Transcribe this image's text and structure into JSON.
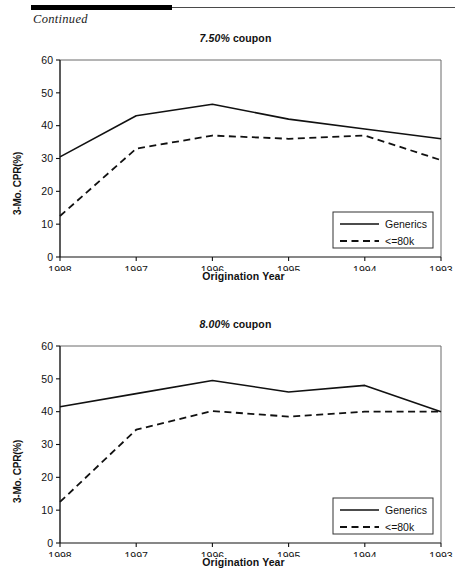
{
  "page": {
    "continued_label": "Continued"
  },
  "axes": {
    "ylabel": "3-Mo. CPR(%)",
    "xlabel": "Origination Year",
    "yticks": [
      "0",
      "10",
      "20",
      "30",
      "40",
      "50",
      "60"
    ],
    "xticks": [
      "1998",
      "1997",
      "1996",
      "1995",
      "1994",
      "1993"
    ]
  },
  "legend": {
    "generics_label": "Generics",
    "lte80k_label": "<=80k"
  },
  "chart_data": [
    {
      "type": "line",
      "title": "7.50% coupon",
      "coupon": "7.50%",
      "coupon_suffix": " coupon",
      "xlabel": "Origination Year",
      "ylabel": "3-Mo. CPR(%)",
      "categories": [
        "1998",
        "1997",
        "1996",
        "1995",
        "1994",
        "1993"
      ],
      "ylim": [
        0,
        60
      ],
      "ytick_step": 10,
      "grid": false,
      "legend_position": "bottom-right",
      "series": [
        {
          "name": "Generics",
          "style": "solid",
          "values": [
            30.5,
            43.0,
            46.5,
            42.0,
            39.0,
            36.0
          ]
        },
        {
          "name": "<=80k",
          "style": "dashed",
          "values": [
            12.5,
            33.0,
            37.0,
            36.0,
            37.0,
            29.5
          ]
        }
      ]
    },
    {
      "type": "line",
      "title": "8.00% coupon",
      "coupon": "8.00%",
      "coupon_suffix": " coupon",
      "xlabel": "Origination Year",
      "ylabel": "3-Mo. CPR(%)",
      "categories": [
        "1998",
        "1997",
        "1996",
        "1995",
        "1994",
        "1993"
      ],
      "ylim": [
        0,
        60
      ],
      "ytick_step": 10,
      "grid": false,
      "legend_position": "bottom-right",
      "series": [
        {
          "name": "Generics",
          "style": "solid",
          "values": [
            41.5,
            45.5,
            49.5,
            46.0,
            48.0,
            40.0
          ]
        },
        {
          "name": "<=80k",
          "style": "dashed",
          "values": [
            12.5,
            34.5,
            40.2,
            38.5,
            40.0,
            40.0
          ]
        }
      ]
    }
  ]
}
